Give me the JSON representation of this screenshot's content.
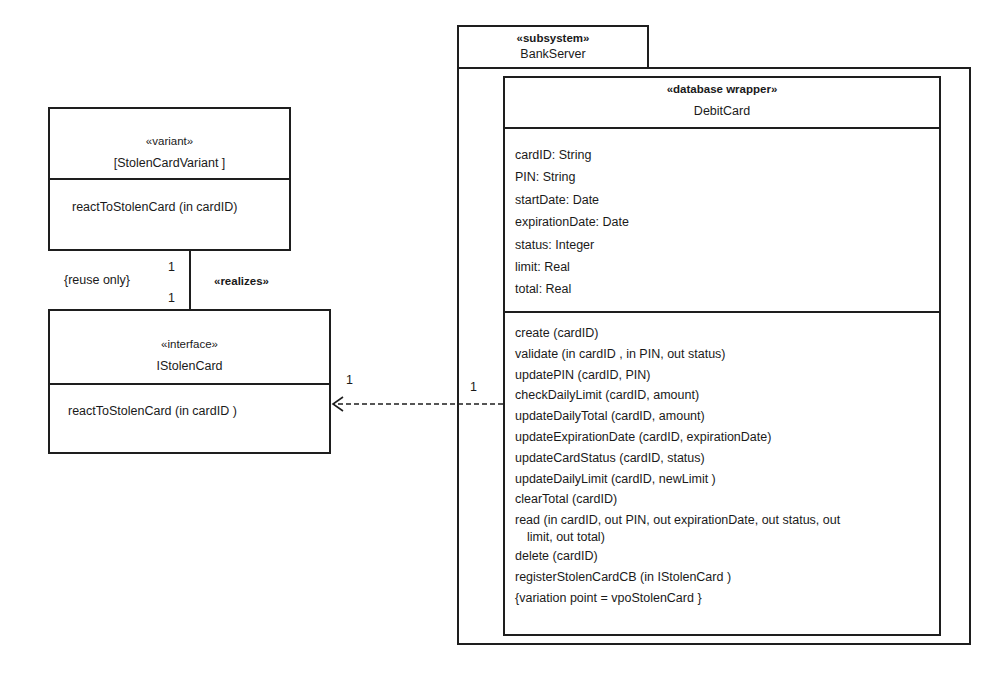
{
  "package": {
    "stereotype": "«subsystem»",
    "name": "BankServer"
  },
  "debit_card": {
    "stereotype": "«database wrapper»",
    "name": "DebitCard",
    "attributes": [
      "cardID: String",
      "PIN: String",
      "startDate: Date",
      "expirationDate: Date",
      "status: Integer",
      "limit: Real",
      "total: Real"
    ],
    "operations": [
      "create (cardID)",
      "validate (in  cardID , in PIN, out status)",
      "updatePIN  (cardID, PIN)",
      "checkDailyLimit   (cardID, amount)",
      "updateDailyTotal   (cardID, amount)",
      "updateExpirationDate   (cardID, expirationDate)",
      "updateCardStatus   (cardID, status)",
      "updateDailyLimit   (cardID,  newLimit )",
      "clearTotal  (cardID)",
      "read (in cardID, out PIN, out expirationDate, out status, out",
      "limit, out total)",
      "delete (cardID)",
      "registerStolenCardCB   (in IStolenCard )",
      "{variation point =   vpoStolenCard }"
    ]
  },
  "variant": {
    "stereotype": "«variant»",
    "name": "[StolenCardVariant ]",
    "operations": [
      "reactToStolenCard   (in cardID)"
    ]
  },
  "interface": {
    "stereotype": "«interface»",
    "name": "IStolenCard",
    "operations": [
      "reactToStolenCard   (in cardID )"
    ]
  },
  "realization": {
    "constraint": "{reuse only}",
    "stereotype": "«realizes»",
    "multiplicity_top": "1",
    "multiplicity_bottom": "1"
  },
  "dependency": {
    "multiplicity_interface": "1",
    "multiplicity_debitcard": "1"
  }
}
